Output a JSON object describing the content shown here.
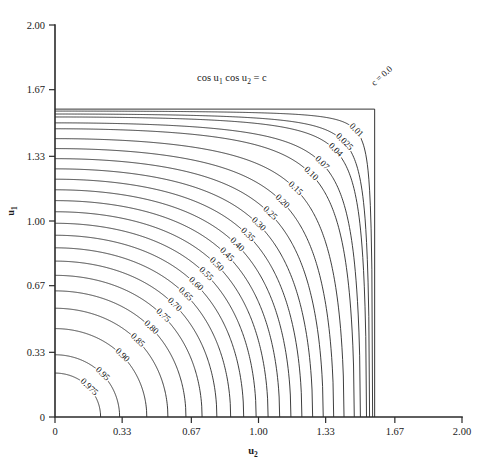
{
  "figure": {
    "equation": "cos u1 cos u2 = c",
    "equation_parts": {
      "prefix1": "cos u",
      "sub1": "1",
      "prefix2": " cos u",
      "sub2": "2",
      "suffix": " = c"
    },
    "background_color": "#ffffff",
    "line_color": "#1c1c1c",
    "axis_color": "#2b2b2b"
  },
  "axes": {
    "x": {
      "label_base": "u",
      "label_sub": "2",
      "ticks": [
        "0",
        "0.33",
        "0.67",
        "1.00",
        "1.33",
        "1.67",
        "2.00"
      ],
      "tick_values": [
        0,
        0.33,
        0.67,
        1.0,
        1.33,
        1.67,
        2.0
      ],
      "range": [
        0,
        2.0
      ]
    },
    "y": {
      "label_base": "u",
      "label_sub": "1",
      "ticks": [
        "0",
        "0.33",
        "0.67",
        "1.00",
        "1.33",
        "1.67",
        "2.00"
      ],
      "tick_values": [
        0,
        0.33,
        0.67,
        1.0,
        1.33,
        1.67,
        2.0
      ],
      "range": [
        0,
        2.0
      ]
    }
  },
  "chart_data": {
    "type": "line",
    "title": "cos u1 cos u2 = c",
    "xlabel": "u2",
    "ylabel": "u1",
    "xlim": [
      0,
      2.0
    ],
    "ylim": [
      0,
      2.0
    ],
    "grid": false,
    "legend": "none",
    "plot_kind": "contour",
    "function": "cos(u1)*cos(u2) = c",
    "levels": [
      0.0,
      0.01,
      0.025,
      0.04,
      0.07,
      0.1,
      0.15,
      0.2,
      0.25,
      0.3,
      0.35,
      0.4,
      0.45,
      0.5,
      0.55,
      0.6,
      0.65,
      0.7,
      0.75,
      0.8,
      0.85,
      0.9,
      0.95,
      0.975
    ],
    "level_labels": [
      "c = 0.0",
      "0.01",
      "0.025",
      "0.04",
      "0.07",
      "0.10",
      "0.15",
      "0.20",
      "0.25",
      "0.30",
      "0.35",
      "0.40",
      "0.45",
      "0.50",
      "0.55",
      "0.60",
      "0.65",
      "0.70",
      "0.75",
      "0.80",
      "0.85",
      "0.90",
      "0.95",
      "0.975"
    ],
    "annotations": [
      {
        "text": "c = 0.0",
        "x": 1.68,
        "y": 1.74
      },
      {
        "text": "cos u1 cos u2 = c",
        "x": 0.8,
        "y": 1.62
      }
    ],
    "axis_intercepts": {
      "note": "each contour c meets the axes at u = arccos(c)",
      "values": [
        {
          "level": 0.0,
          "intercept": 1.5708
        },
        {
          "level": 0.01,
          "intercept": 1.5608
        },
        {
          "level": 0.025,
          "intercept": 1.5458
        },
        {
          "level": 0.04,
          "intercept": 1.5308
        },
        {
          "level": 0.07,
          "intercept": 1.5007
        },
        {
          "level": 0.1,
          "intercept": 1.4706
        },
        {
          "level": 0.15,
          "intercept": 1.4202
        },
        {
          "level": 0.2,
          "intercept": 1.3694
        },
        {
          "level": 0.25,
          "intercept": 1.3181
        },
        {
          "level": 0.3,
          "intercept": 1.2661
        },
        {
          "level": 0.35,
          "intercept": 1.2132
        },
        {
          "level": 0.4,
          "intercept": 1.1593
        },
        {
          "level": 0.45,
          "intercept": 1.104
        },
        {
          "level": 0.5,
          "intercept": 1.0472
        },
        {
          "level": 0.55,
          "intercept": 0.9884
        },
        {
          "level": 0.6,
          "intercept": 0.9273
        },
        {
          "level": 0.65,
          "intercept": 0.8632
        },
        {
          "level": 0.7,
          "intercept": 0.7954
        },
        {
          "level": 0.75,
          "intercept": 0.7227
        },
        {
          "level": 0.8,
          "intercept": 0.6435
        },
        {
          "level": 0.85,
          "intercept": 0.5548
        },
        {
          "level": 0.9,
          "intercept": 0.451
        },
        {
          "level": 0.95,
          "intercept": 0.3176
        },
        {
          "level": 0.975,
          "intercept": 0.224
        }
      ]
    }
  },
  "geometry": {
    "plot_left": 55,
    "plot_right": 462,
    "plot_top": 25,
    "plot_bottom": 417
  }
}
